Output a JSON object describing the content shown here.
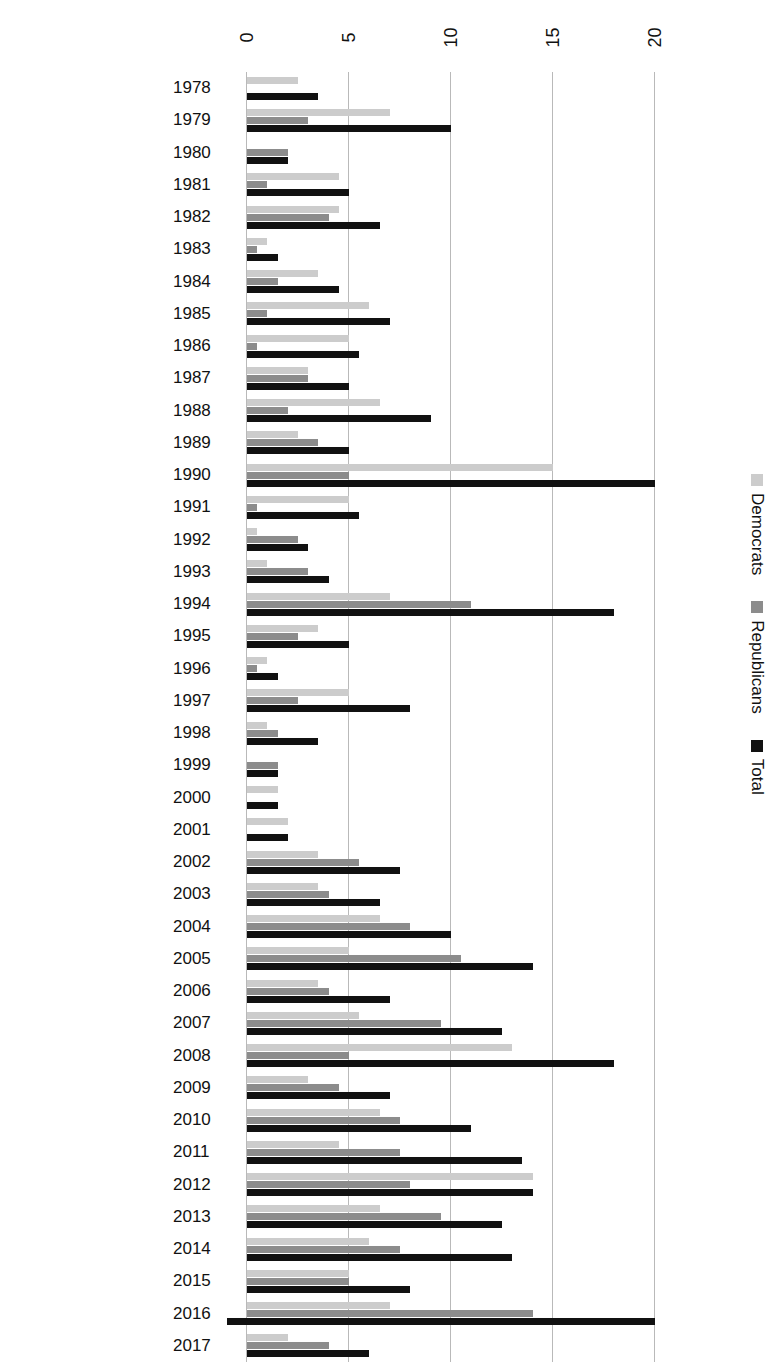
{
  "chart_data": {
    "type": "bar",
    "orientation": "horizontal",
    "title": "",
    "subtitle": "",
    "xlabel": "",
    "ylabel": "",
    "xlim": [
      0,
      21.5
    ],
    "ylim": null,
    "grid": true,
    "grid_axis": "x",
    "legend_position": "bottom-left",
    "xticks": [
      "0",
      "5",
      "10",
      "15",
      "20"
    ],
    "xtick_values": [
      0,
      5,
      10,
      15,
      20
    ],
    "categories": [
      "2017",
      "2016",
      "2015",
      "2014",
      "2013",
      "2012",
      "2011",
      "2010",
      "2009",
      "2008",
      "2007",
      "2006",
      "2005",
      "2004",
      "2003",
      "2002",
      "2001",
      "2000",
      "1999",
      "1998",
      "1997",
      "1996",
      "1995",
      "1994",
      "1993",
      "1992",
      "1991",
      "1990",
      "1989",
      "1988",
      "1987",
      "1986",
      "1985",
      "1984",
      "1983",
      "1982",
      "1981",
      "1980",
      "1979",
      "1978"
    ],
    "series": [
      {
        "name": "Total",
        "color": "#111111",
        "values": [
          6.0,
          21.0,
          8.0,
          13.0,
          12.5,
          14.0,
          13.5,
          11.0,
          7.0,
          18.0,
          12.5,
          7.0,
          14.0,
          10.0,
          6.5,
          7.5,
          2.0,
          1.5,
          1.5,
          3.5,
          8.0,
          1.5,
          5.0,
          18.0,
          4.0,
          3.0,
          5.5,
          20.0,
          5.0,
          9.0,
          5.0,
          5.5,
          7.0,
          4.5,
          1.5,
          6.5,
          5.0,
          2.0,
          10.0,
          3.5
        ]
      },
      {
        "name": "Republicans",
        "color": "#8c8c8c",
        "values": [
          4.0,
          14.0,
          5.0,
          7.5,
          9.5,
          8.0,
          7.5,
          7.5,
          4.5,
          5.0,
          9.5,
          4.0,
          10.5,
          8.0,
          4.0,
          5.5,
          0.0,
          0.0,
          1.5,
          1.5,
          2.5,
          0.5,
          2.5,
          11.0,
          3.0,
          2.5,
          0.5,
          5.0,
          3.5,
          2.0,
          3.0,
          0.5,
          1.0,
          1.5,
          0.5,
          4.0,
          1.0,
          2.0,
          3.0,
          0.0
        ]
      },
      {
        "name": "Democrats",
        "color": "#cccccc",
        "values": [
          2.0,
          7.0,
          5.0,
          6.0,
          6.5,
          14.0,
          4.5,
          6.5,
          3.0,
          13.0,
          5.5,
          3.5,
          5.0,
          6.5,
          3.5,
          3.5,
          2.0,
          1.5,
          0.0,
          1.0,
          5.0,
          1.0,
          3.5,
          7.0,
          1.0,
          0.5,
          5.0,
          15.0,
          2.5,
          6.5,
          3.0,
          5.0,
          6.0,
          3.5,
          1.0,
          4.5,
          4.5,
          0.0,
          7.0,
          2.5
        ]
      }
    ]
  },
  "legend": {
    "entries": [
      {
        "label": "Democrats",
        "color": "#cccccc"
      },
      {
        "label": "Republicans",
        "color": "#8c8c8c"
      },
      {
        "label": "Total",
        "color": "#111111"
      }
    ]
  }
}
